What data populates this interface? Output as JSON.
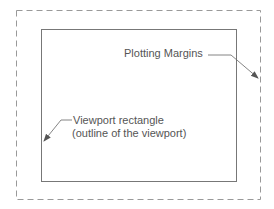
{
  "diagram": {
    "labels": {
      "plotting_margins": "Plotting Margins",
      "viewport_line1": "Viewport rectangle",
      "viewport_line2": "(outline of the viewport)"
    },
    "colors": {
      "outline": "#777777",
      "dashed": "#999999",
      "text": "#555555",
      "background": "#ffffff"
    }
  }
}
